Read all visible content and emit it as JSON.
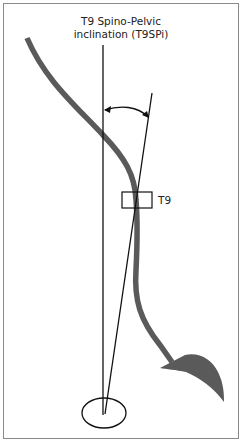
{
  "diagram": {
    "title_line1": "T9 Spino-Pelvic",
    "title_line2": "inclination (T9SPi)",
    "vertebra_label": "T9",
    "colors": {
      "spine": "#5a5a5a",
      "lines": "#111111",
      "frame": "#8a8a8a",
      "background": "#ffffff"
    },
    "elements": [
      {
        "name": "vertical-reference-line",
        "description": "Vertical line through femoral head center"
      },
      {
        "name": "t9-line",
        "description": "Line from femoral head center to T9 vertebra center"
      },
      {
        "name": "angle-arc",
        "description": "Arrowed arc indicating T9 spino-pelvic inclination angle"
      },
      {
        "name": "t9-vertebra-box",
        "description": "Rectangle marking T9 vertebra"
      },
      {
        "name": "spine-curve",
        "description": "Sagittal spine profile ending in sacrum"
      },
      {
        "name": "femoral-head",
        "description": "Ellipse representing femoral head"
      }
    ]
  }
}
